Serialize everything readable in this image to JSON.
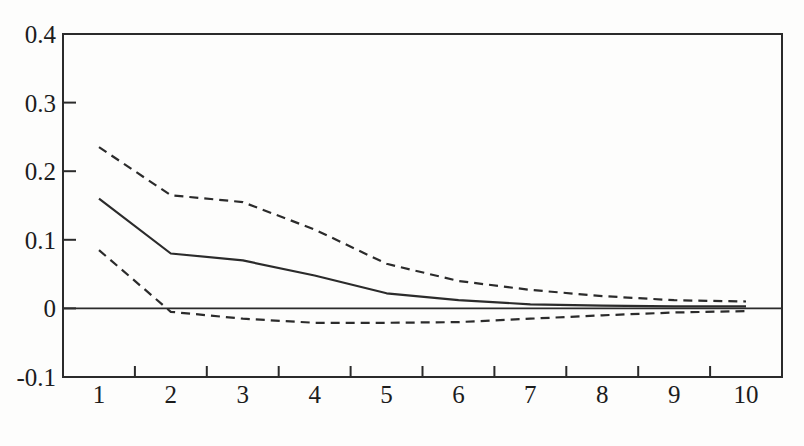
{
  "figure": {
    "background_color": "#fdfdfc",
    "ink_color": "#2b2b2b",
    "label_color": "#1c1c1c"
  },
  "chart_data": {
    "type": "line",
    "title": "",
    "xlabel": "",
    "ylabel": "",
    "grid": false,
    "legend": "none",
    "xlim": [
      0.5,
      10.5
    ],
    "ylim": [
      -0.1,
      0.4
    ],
    "x": [
      1,
      2,
      3,
      4,
      5,
      6,
      7,
      8,
      9,
      10
    ],
    "x_tick_labels": [
      "1",
      "2",
      "3",
      "4",
      "5",
      "6",
      "7",
      "8",
      "9",
      "10"
    ],
    "x_minor_ticks": [
      1.5,
      2.5,
      3.5,
      4.5,
      5.5,
      6.5,
      7.5,
      8.5,
      9.5
    ],
    "y_ticks": [
      {
        "value": -0.1,
        "label": "-0.1",
        "tick": false
      },
      {
        "value": 0,
        "label": "0",
        "tick": true
      },
      {
        "value": 0.1,
        "label": "0.1",
        "tick": true
      },
      {
        "value": 0.2,
        "label": "0.2",
        "tick": true
      },
      {
        "value": 0.3,
        "label": "0.3",
        "tick": true
      },
      {
        "value": 0.4,
        "label": "0.4",
        "tick": false
      }
    ],
    "zero_line": true,
    "series": [
      {
        "name": "upper-band",
        "style": "dashed",
        "values": [
          0.235,
          0.165,
          0.155,
          0.115,
          0.065,
          0.04,
          0.027,
          0.018,
          0.012,
          0.01
        ]
      },
      {
        "name": "point-estimate",
        "style": "solid",
        "values": [
          0.16,
          0.08,
          0.07,
          0.048,
          0.022,
          0.012,
          0.006,
          0.004,
          0.003,
          0.003
        ]
      },
      {
        "name": "lower-band",
        "style": "dashed",
        "values": [
          0.085,
          -0.005,
          -0.015,
          -0.021,
          -0.021,
          -0.02,
          -0.015,
          -0.01,
          -0.006,
          -0.004
        ]
      }
    ]
  }
}
